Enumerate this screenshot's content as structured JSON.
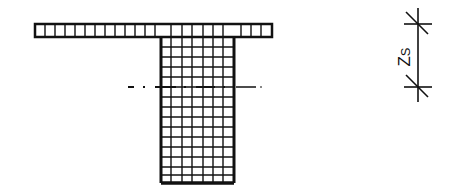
{
  "diagram": {
    "dimension_label": "Z",
    "dimension_subscript": "S",
    "colors": {
      "stroke": "#111111",
      "background": "#ffffff"
    },
    "flange": {
      "x": 35,
      "y": 24,
      "width": 237,
      "height": 13,
      "cells": 24
    },
    "web": {
      "x": 161,
      "y": 37,
      "width": 73,
      "height": 146,
      "cols": 7,
      "rows": 15
    },
    "centroid_axis": {
      "y": 87,
      "x1": 128,
      "x2": 262
    },
    "dimension": {
      "x": 418,
      "y1": 24,
      "y2": 87
    }
  }
}
